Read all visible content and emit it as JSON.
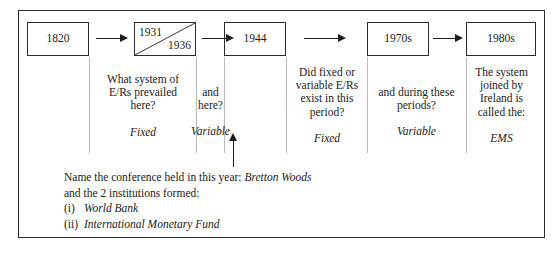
{
  "worksheet": {
    "timeline": [
      {
        "name": "box-1820",
        "label": "1820",
        "style": "center"
      },
      {
        "name": "box-1931-1936",
        "label_top": "1931",
        "label_bottom": "1936",
        "style": "split-diagonal"
      },
      {
        "name": "box-1944",
        "label": "1944",
        "style": "center"
      },
      {
        "name": "box-1970s",
        "label": "1970s",
        "style": "center"
      },
      {
        "name": "box-1980s",
        "label": "1980s",
        "style": "center"
      }
    ],
    "columns": [
      {
        "name": "column-1820",
        "question": "",
        "answer": ""
      },
      {
        "name": "column-1820-1931",
        "question": "What system of\nE/Rs prevailed\nhere?",
        "answer": "Fixed"
      },
      {
        "name": "column-1931-1936",
        "question": "and\nhere?",
        "answer": "Variable"
      },
      {
        "name": "column-1944",
        "question": "",
        "answer": ""
      },
      {
        "name": "column-1944-1970",
        "question": "Did fixed or\nvariable E/Rs\nexist in this\nperiod?",
        "answer": "Fixed"
      },
      {
        "name": "column-1970s",
        "question": "and during these\nperiods?",
        "answer": "Variable"
      },
      {
        "name": "column-1980s",
        "question": "The system\njoined by\nIreland is\ncalled the:",
        "answer": "EMS"
      }
    ],
    "prompt": {
      "line1_label": "Name the conference held in this year:",
      "line1_answer": "Bretton Woods",
      "line2": "and the 2 institutions formed:",
      "item1_marker": "(i)",
      "item1_answer": "World Bank",
      "item2_marker": "(ii)",
      "item2_answer": "International Monetary Fund"
    },
    "colors": {
      "ink": "#1a1a1a",
      "border": "#2b2b2b",
      "rule": "#b9b9b9",
      "background": "#ffffff"
    }
  }
}
